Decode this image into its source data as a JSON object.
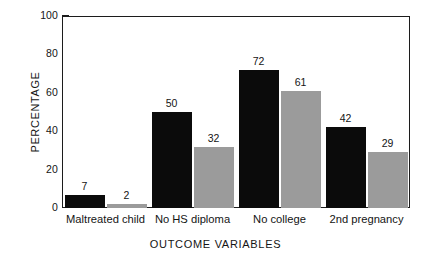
{
  "chart_data": {
    "type": "bar",
    "title": "",
    "subtitle": "",
    "xlabel": "OUTCOME VARIABLES",
    "ylabel": "PERCENTAGE",
    "categories": [
      "Maltreated child",
      "No HS diploma",
      "No college",
      "2nd pregnancy"
    ],
    "series": [
      {
        "name": "series-1",
        "color": "#0b0b0b",
        "values": [
          7,
          50,
          72,
          42
        ]
      },
      {
        "name": "series-2",
        "color": "#9b9b9b",
        "values": [
          2,
          32,
          61,
          29
        ]
      }
    ],
    "ylim": [
      0,
      100
    ],
    "yticks": [
      0,
      20,
      40,
      60,
      80,
      100
    ],
    "ytick_labels": [
      "0",
      "20",
      "40",
      "60",
      "80",
      "100"
    ],
    "grid": false,
    "legend": "none",
    "bar_value_labels": [
      [
        "7",
        "2"
      ],
      [
        "50",
        "32"
      ],
      [
        "72",
        "61"
      ],
      [
        "42",
        "29"
      ]
    ],
    "frame": "box",
    "tick_direction": "in",
    "background_color": "#ffffff",
    "axis_color": "#1c1c1c"
  },
  "axes": {
    "y_title": "PERCENTAGE",
    "x_title": "OUTCOME VARIABLES",
    "y_ticks": [
      {
        "label": "100",
        "value": 100
      },
      {
        "label": "80",
        "value": 80
      },
      {
        "label": "60",
        "value": 60
      },
      {
        "label": "40",
        "value": 40
      },
      {
        "label": "20",
        "value": 20
      },
      {
        "label": "0",
        "value": 0
      }
    ]
  },
  "groups": [
    {
      "category": "Maltreated child",
      "bars": [
        {
          "value": 7,
          "label": "7",
          "variant": "dark"
        },
        {
          "value": 2,
          "label": "2",
          "variant": "light"
        }
      ]
    },
    {
      "category": "No HS diploma",
      "bars": [
        {
          "value": 50,
          "label": "50",
          "variant": "dark"
        },
        {
          "value": 32,
          "label": "32",
          "variant": "light"
        }
      ]
    },
    {
      "category": "No college",
      "bars": [
        {
          "value": 72,
          "label": "72",
          "variant": "dark"
        },
        {
          "value": 61,
          "label": "61",
          "variant": "light"
        }
      ]
    },
    {
      "category": "2nd pregnancy",
      "bars": [
        {
          "value": 42,
          "label": "42",
          "variant": "dark"
        },
        {
          "value": 29,
          "label": "29",
          "variant": "light"
        }
      ]
    }
  ]
}
